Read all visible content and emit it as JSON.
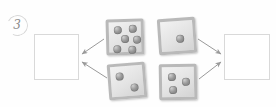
{
  "worksheet": {
    "item_number": "3",
    "background_color": "#ffffff",
    "pip_color": "#6e6e6e",
    "tile_border_color": "#b9b9b9",
    "box_border_color": "#d9d9d9",
    "arrow_color": "#9a9a9a"
  },
  "answer_boxes": [
    {
      "id": "left",
      "value": "",
      "placeholder": ""
    },
    {
      "id": "right",
      "value": "",
      "placeholder": ""
    }
  ],
  "dice": [
    {
      "id": "dice-six",
      "position": "top-left",
      "pips": 6,
      "points_to": "left",
      "pip_layout": [
        {
          "x": 5,
          "y": 4
        },
        {
          "x": 20,
          "y": 3
        },
        {
          "x": 12,
          "y": 13
        },
        {
          "x": 24,
          "y": 14
        },
        {
          "x": 4,
          "y": 23
        },
        {
          "x": 19,
          "y": 24
        }
      ]
    },
    {
      "id": "dice-one",
      "position": "top-right",
      "pips": 1,
      "points_to": "right",
      "pip_layout": [
        {
          "x": 15,
          "y": 14
        }
      ]
    },
    {
      "id": "dice-two",
      "position": "bottom-left",
      "pips": 2,
      "points_to": "left",
      "pip_layout": [
        {
          "x": 5,
          "y": 6
        },
        {
          "x": 19,
          "y": 18
        }
      ]
    },
    {
      "id": "dice-three",
      "position": "bottom-right",
      "pips": 3,
      "points_to": "right",
      "pip_layout": [
        {
          "x": 6,
          "y": 6
        },
        {
          "x": 20,
          "y": 11
        },
        {
          "x": 7,
          "y": 19
        }
      ]
    }
  ],
  "arrows": [
    {
      "id": "arrow-six-to-left",
      "from": "dice-six",
      "to": "answer-left"
    },
    {
      "id": "arrow-two-to-left",
      "from": "dice-two",
      "to": "answer-left"
    },
    {
      "id": "arrow-one-to-right",
      "from": "dice-one",
      "to": "answer-right"
    },
    {
      "id": "arrow-three-to-right",
      "from": "dice-three",
      "to": "answer-right"
    }
  ]
}
